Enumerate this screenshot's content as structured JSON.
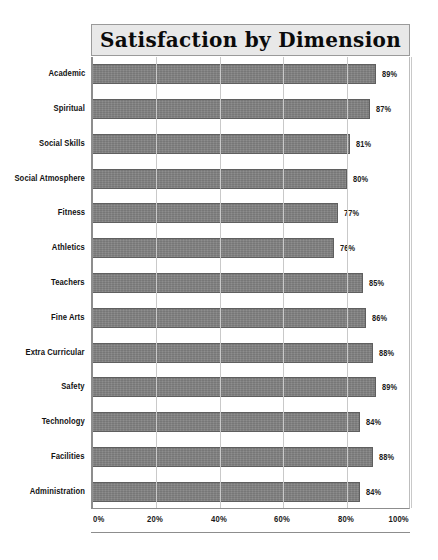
{
  "chart_data": {
    "type": "bar",
    "orientation": "horizontal",
    "title": "Satisfaction by Dimension",
    "xlabel": "",
    "ylabel": "",
    "xlim": [
      0,
      100
    ],
    "grid": true,
    "legend": null,
    "categories": [
      "Academic",
      "Spiritual",
      "Social Skills",
      "Social Atmosphere",
      "Fitness",
      "Athletics",
      "Teachers",
      "Fine Arts",
      "Extra Curricular",
      "Safety",
      "Technology",
      "Facilities",
      "Administration"
    ],
    "values": [
      89,
      87,
      81,
      80,
      77,
      76,
      85,
      86,
      88,
      89,
      84,
      88,
      84
    ],
    "value_labels": [
      "89%",
      "87%",
      "81%",
      "80%",
      "77%",
      "76%",
      "85%",
      "86%",
      "88%",
      "89%",
      "84%",
      "88%",
      "84%"
    ],
    "xticks": [
      0,
      20,
      40,
      60,
      80,
      100
    ],
    "xtick_labels": [
      "0%",
      "20%",
      "40%",
      "60%",
      "80%",
      "100%"
    ],
    "colors": {
      "bar_fill": "#818181",
      "bar_edge": "#5f5f5f",
      "gridline": "#c9c9c9",
      "axis": "#8d8d8d",
      "title_band": "#e8e8e8",
      "text": "#121212",
      "background": "#ffffff"
    }
  }
}
